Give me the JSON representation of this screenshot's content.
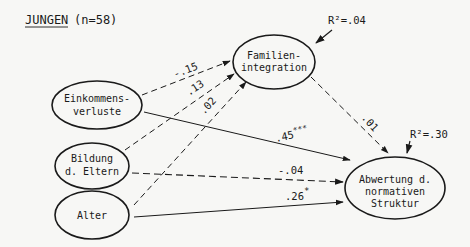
{
  "title": {
    "group": "JUNGEN",
    "n": "(n=58)"
  },
  "nodes": {
    "einkommen": {
      "line1": "Einkommens-",
      "line2": "verluste"
    },
    "bildung": {
      "line1": "Bildung",
      "line2": "d. Eltern"
    },
    "alter": {
      "line1": "Alter"
    },
    "familie": {
      "line1": "Familien-",
      "line2": "integration"
    },
    "abwertung": {
      "line1": "Abwertung d.",
      "line2": "normativen",
      "line3": "Struktur"
    }
  },
  "r_squared": {
    "familie": "R²=.04",
    "abwertung": "R²=.30"
  },
  "paths": {
    "einkommen_familie": ".15",
    "einkommen_familie_sign": "-",
    "bildung_familie": ".13",
    "alter_familie": ".02",
    "familie_abwertung": ".01",
    "einkommen_abwertung": ".45",
    "einkommen_abwertung_sig": "***",
    "bildung_abwertung": "-.04",
    "alter_abwertung": ".26",
    "alter_abwertung_sig": "*"
  }
}
